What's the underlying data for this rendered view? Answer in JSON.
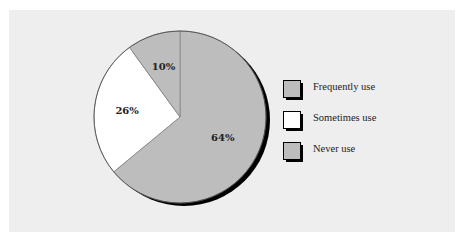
{
  "chart_data": {
    "type": "pie",
    "title": "",
    "slices": [
      {
        "label": "Frequently use",
        "value": 64,
        "display": "64%",
        "color": "#bdbdbd"
      },
      {
        "label": "Sometimes use",
        "value": 26,
        "display": "26%",
        "color": "#ffffff"
      },
      {
        "label": "Never use",
        "value": 10,
        "display": "10%",
        "color": "#bdbdbd"
      }
    ],
    "legend": {
      "position": "right",
      "entries": [
        "Frequently use",
        "Sometimes use",
        "Never use"
      ]
    },
    "start_angle_deg": 0,
    "direction": "clockwise"
  },
  "colors": {
    "panel_bg": "#eeeeee",
    "shadow": "#000000"
  }
}
